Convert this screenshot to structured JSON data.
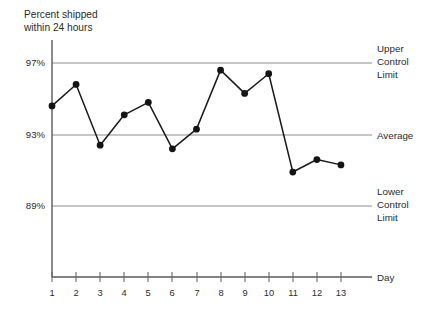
{
  "chart_data": {
    "type": "line",
    "title": "Percent shipped within 24 hours",
    "title_lines": [
      "Percent shipped",
      "within 24 hours"
    ],
    "xlabel": "Day",
    "ylabel": "",
    "x": [
      1,
      2,
      3,
      4,
      5,
      6,
      7,
      8,
      9,
      10,
      11,
      12,
      13
    ],
    "categories": [
      "1",
      "2",
      "3",
      "4",
      "5",
      "6",
      "7",
      "8",
      "9",
      "10",
      "11",
      "12",
      "13"
    ],
    "values": [
      94.6,
      95.8,
      92.4,
      94.1,
      94.8,
      92.2,
      93.3,
      96.6,
      95.3,
      96.4,
      90.9,
      91.6,
      91.3
    ],
    "series": [
      {
        "name": "Percent shipped within 24 hours",
        "values": [
          94.6,
          95.8,
          92.4,
          94.1,
          94.8,
          92.2,
          93.3,
          96.6,
          95.3,
          96.4,
          90.9,
          91.6,
          91.3
        ]
      }
    ],
    "ylim": [
      87.0,
      98.2
    ],
    "xlim": [
      0.6,
      13.6
    ],
    "yticks": [
      97,
      93,
      89
    ],
    "ytick_labels": [
      "97%",
      "93%",
      "89%"
    ],
    "grid": true,
    "grid_axis": "y",
    "legend": "none",
    "reference_lines": [
      {
        "id": "ucl",
        "value": 97,
        "label_lines": [
          "Upper",
          "Control",
          "Limit"
        ],
        "label": "Upper Control Limit"
      },
      {
        "id": "average",
        "value": 93,
        "label_lines": [
          "Average"
        ],
        "label": "Average"
      },
      {
        "id": "lcl",
        "value": 89,
        "label_lines": [
          "Lower",
          "Control",
          "Limit"
        ],
        "label": "Lower Control Limit"
      }
    ],
    "colors": {
      "line": "#1a1a1a",
      "marker": "#141414",
      "grid": "#8d8d8d",
      "axis": "#5a5a5a",
      "background": "#ffffff",
      "text": "#2b2b2b"
    }
  },
  "axes": {
    "y_labels": [
      "97%",
      "93%",
      "89%"
    ],
    "x_labels": [
      "1",
      "2",
      "3",
      "4",
      "5",
      "6",
      "7",
      "8",
      "9",
      "10",
      "11",
      "12",
      "13"
    ],
    "x_axis_title": "Day"
  },
  "annotations": {
    "ucl": {
      "l1": "Upper",
      "l2": "Control",
      "l3": "Limit"
    },
    "average": {
      "l1": "Average"
    },
    "lcl": {
      "l1": "Lower",
      "l2": "Control",
      "l3": "Limit"
    }
  },
  "title": {
    "l1": "Percent shipped",
    "l2": "within 24 hours"
  }
}
